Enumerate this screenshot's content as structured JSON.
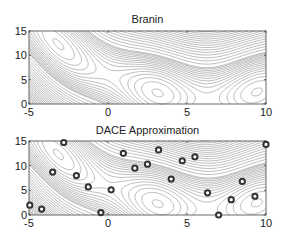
{
  "chart_data": [
    {
      "type": "contour",
      "title": "Branin",
      "function": "branin",
      "xlabel": "",
      "ylabel": "",
      "xlim": [
        -5,
        10
      ],
      "ylim": [
        0,
        15
      ],
      "xticks": [
        -5,
        0,
        5,
        10
      ],
      "yticks": [
        0,
        5,
        10,
        15
      ],
      "grid": false,
      "contour_color": "#555555"
    },
    {
      "type": "contour",
      "title": "DACE Approximation",
      "function": "branin_approx",
      "xlabel": "",
      "ylabel": "",
      "xlim": [
        -5,
        10
      ],
      "ylim": [
        0,
        15
      ],
      "xticks": [
        -5,
        0,
        5,
        10
      ],
      "yticks": [
        0,
        5,
        10,
        15
      ],
      "grid": false,
      "contour_color": "#555555",
      "sample_points": {
        "marker": "circle",
        "color": "#333333",
        "x": [
          -2.8,
          -3.5,
          -2.0,
          -1.25,
          -4.95,
          -4.2,
          -0.45,
          0.97,
          3.2,
          4.7,
          2.5,
          1.7,
          4.0,
          0.2,
          5.5,
          10.0,
          8.5,
          6.3,
          7.8,
          9.3,
          7.0
        ],
        "y": [
          14.7,
          8.7,
          8.0,
          5.7,
          2.0,
          1.2,
          0.5,
          12.5,
          13.2,
          11.0,
          10.3,
          9.5,
          7.3,
          5.1,
          11.8,
          14.3,
          6.8,
          4.5,
          3.1,
          3.8,
          0.0
        ]
      }
    }
  ]
}
